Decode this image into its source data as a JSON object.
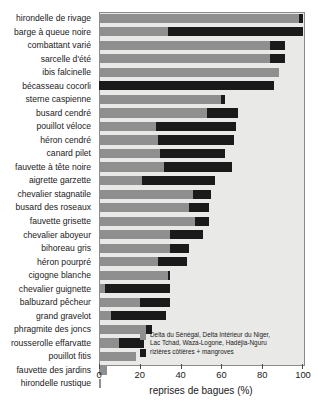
{
  "chart_data": {
    "type": "bar",
    "orientation": "horizontal",
    "stacked": true,
    "title": "",
    "xlabel": "reprises de bagues (%)",
    "ylabel": "",
    "xlim": [
      0,
      100
    ],
    "xticks": [
      0,
      20,
      40,
      60,
      80,
      100
    ],
    "grid": false,
    "legend_position": "inside-bottom-right",
    "colors": {
      "series1": "#8f8f8f",
      "series2": "#1a1a1a",
      "plot_background": "#e9e9e7"
    },
    "categories": [
      "hirondelle de rivage",
      "barge à queue noire",
      "combattant varié",
      "sarcelle d'été",
      "ibis falcinelle",
      "bécasseau cocorli",
      "sterne caspienne",
      "busard cendré",
      "pouillot véloce",
      "héron cendré",
      "canard pilet",
      "fauvette à tête noire",
      "aigrette garzette",
      "chevalier stagnatile",
      "busard des roseaux",
      "fauvette grisette",
      "chevalier aboyeur",
      "bihoreau gris",
      "héron pourpré",
      "cigogne blanche",
      "chevalier guignette",
      "balbuzard pêcheur",
      "grand gravelot",
      "phragmite des joncs",
      "rousserolle effarvatte",
      "pouillot fitis",
      "fauvette des jardins",
      "hirondelle rustique"
    ],
    "series": [
      {
        "name": "Delta du Sénégal, Delta Intérieur du Niger, Lac Tchad, Waza-Logone, Hadéjia-Nguru",
        "color": "#8f8f8f",
        "values": [
          98,
          34,
          84,
          84,
          88,
          0,
          60,
          53,
          28,
          29,
          30,
          32,
          21,
          46,
          44,
          47,
          35,
          35,
          29,
          34,
          3,
          20,
          6,
          23,
          10,
          18,
          4,
          1
        ]
      },
      {
        "name": "rizières côtières + mangroves",
        "color": "#1a1a1a",
        "values": [
          2,
          66,
          7,
          7,
          0,
          86,
          2,
          15,
          39,
          37,
          32,
          33,
          36,
          9,
          10,
          7,
          16,
          9,
          14,
          1,
          32,
          15,
          27,
          3,
          12,
          0,
          0,
          0
        ]
      }
    ],
    "totals": [
      100,
      100,
      91,
      91,
      88,
      86,
      62,
      68,
      67,
      66,
      62,
      65,
      57,
      55,
      54,
      54,
      51,
      44,
      43,
      35,
      35,
      35,
      33,
      26,
      22,
      18,
      4,
      1
    ]
  },
  "axis": {
    "x_title": "reprises de bagues (%)",
    "tick_labels": [
      "0",
      "20",
      "40",
      "60",
      "80",
      "100"
    ]
  },
  "legend": {
    "entries": [
      {
        "swatch": "grey",
        "label": "Delta du Sénégal, Delta Intérieur du Niger,\nLac Tchad, Waza-Logone, Hadéjia-Nguru"
      },
      {
        "swatch": "black",
        "label": "rizières côtières + mangroves"
      }
    ]
  }
}
